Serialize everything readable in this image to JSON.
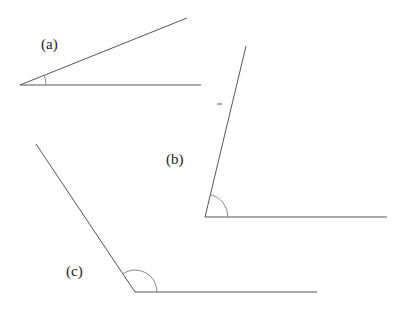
{
  "diagram": {
    "title": "",
    "angles": [
      {
        "id": "a",
        "label": "(a)",
        "label_pos": [
          41,
          49
        ],
        "vertex": [
          20,
          85
        ],
        "ray1_end": [
          201,
          85
        ],
        "ray2_end": [
          187,
          18
        ],
        "arc_radius": 26,
        "type": "acute"
      },
      {
        "id": "b",
        "label": "(b)",
        "label_pos": [
          166,
          164
        ],
        "vertex": [
          205,
          217
        ],
        "ray1_end": [
          387,
          217
        ],
        "ray2_end": [
          246,
          46
        ],
        "arc_radius": 23,
        "type": "acute",
        "tick_mark": [
          [
            217,
            104
          ],
          [
            222,
            104
          ]
        ]
      },
      {
        "id": "c",
        "label": "(c)",
        "label_pos": [
          66,
          276
        ],
        "vertex": [
          135,
          292
        ],
        "ray1_end": [
          317,
          292
        ],
        "ray2_end": [
          36,
          144
        ],
        "arc_radius": 22,
        "type": "obtuse"
      }
    ]
  }
}
